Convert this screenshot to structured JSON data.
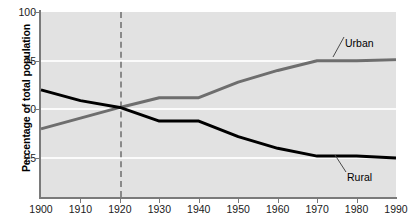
{
  "chart_data": {
    "type": "line",
    "title": "",
    "subtitle": "",
    "xlabel": "",
    "ylabel": "Percentage of total population",
    "x": [
      1900,
      1910,
      1920,
      1930,
      1940,
      1950,
      1960,
      1970,
      1980,
      1990
    ],
    "xtick_labels": [
      "1900",
      "1910",
      "1920",
      "1930",
      "1940",
      "1950",
      "1960",
      "1970",
      "1980",
      "1990"
    ],
    "ytick_labels": [
      "100",
      "75",
      "50",
      "25"
    ],
    "yticks": [
      100,
      75,
      50,
      25
    ],
    "xlim": [
      1900,
      1990
    ],
    "ylim": [
      5,
      100
    ],
    "grid": "horizontal-white",
    "legend_position": "inline-annotations",
    "series": [
      {
        "name": "Urban",
        "color": "#6e6e6e",
        "values": [
          40,
          45.5,
          51,
          56,
          56,
          64,
          70,
          75,
          75,
          75.5
        ]
      },
      {
        "name": "Rural",
        "color": "#000000",
        "values": [
          60,
          54.5,
          51,
          44,
          44,
          36,
          30,
          26,
          26,
          25
        ]
      }
    ],
    "annotations": [
      {
        "label": "Urban",
        "target_x": 1972,
        "target_y": 75
      },
      {
        "label": "Rural",
        "target_x": 1972,
        "target_y": 26
      }
    ],
    "reference_lines": [
      {
        "axis": "x",
        "value": 1920,
        "style": "dashed",
        "color": "#8a8a8a"
      }
    ]
  },
  "colors": {
    "plot_background": "#e2e2e2",
    "page_background": "#ffffff",
    "gridline": "#fbfbfb",
    "axis": "#7a7a7a",
    "urban_series": "#6e6e6e",
    "rural_series": "#000000",
    "marker_line": "#8a8a8a",
    "text": "#1a1a1a"
  }
}
